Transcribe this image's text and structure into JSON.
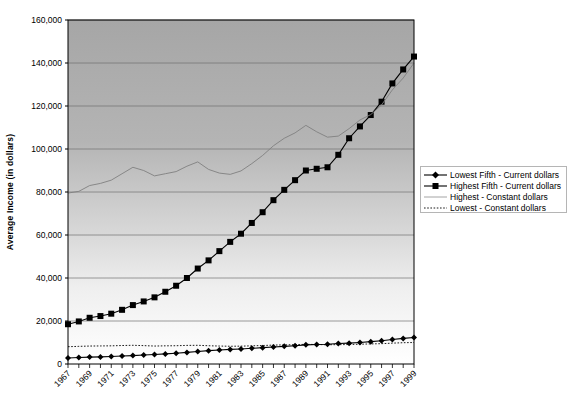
{
  "chart_data": {
    "type": "line",
    "title": "",
    "xlabel": "",
    "ylabel": "Average Income (in dollars)",
    "ylim": [
      0,
      160000
    ],
    "ytick_values": [
      0,
      20000,
      40000,
      60000,
      80000,
      100000,
      120000,
      140000,
      160000
    ],
    "ytick_labels": [
      "0",
      "20,000",
      "40,000",
      "60,000",
      "80,000",
      "100,000",
      "120,000",
      "140,000",
      "160,000"
    ],
    "grid": true,
    "grid_axis": "y",
    "legend_position": "right",
    "x": [
      1967,
      1968,
      1969,
      1970,
      1971,
      1972,
      1973,
      1974,
      1975,
      1976,
      1977,
      1978,
      1979,
      1980,
      1981,
      1982,
      1983,
      1984,
      1985,
      1986,
      1987,
      1988,
      1989,
      1990,
      1991,
      1992,
      1993,
      1994,
      1995,
      1996,
      1997,
      1998,
      1999
    ],
    "xtick_labels": [
      "1967",
      "1969",
      "1971",
      "1973",
      "1975",
      "1977",
      "1979",
      "1981",
      "1983",
      "1985",
      "1987",
      "1989",
      "1991",
      "1993",
      "1995",
      "1997",
      "1999"
    ],
    "xtick_values": [
      1967,
      1969,
      1971,
      1973,
      1975,
      1977,
      1979,
      1981,
      1983,
      1985,
      1987,
      1989,
      1991,
      1993,
      1995,
      1997,
      1999
    ],
    "series": [
      {
        "name": "Lowest Fifth - Current dollars",
        "marker": "diamond",
        "line_style": "solid",
        "color": "#000000",
        "values": [
          2800,
          3000,
          3200,
          3300,
          3500,
          3700,
          3900,
          4200,
          4400,
          4700,
          5000,
          5400,
          5800,
          6200,
          6500,
          6800,
          7000,
          7300,
          7600,
          7900,
          8200,
          8500,
          8900,
          9100,
          9200,
          9500,
          9700,
          10000,
          10400,
          10800,
          11400,
          11900,
          12300
        ]
      },
      {
        "name": "Highest Fifth - Current dollars",
        "marker": "square",
        "line_style": "solid",
        "color": "#000000",
        "values": [
          18500,
          19800,
          21500,
          22300,
          23400,
          25200,
          27400,
          29100,
          31000,
          33600,
          36400,
          40000,
          44400,
          48200,
          52500,
          56800,
          60600,
          65600,
          70600,
          76200,
          81000,
          85500,
          90000,
          90800,
          91500,
          97300,
          105000,
          110500,
          115800,
          122000,
          130500,
          137000,
          143000
        ]
      },
      {
        "name": "Highest - Constant dollars",
        "marker": "none",
        "line_style": "solid",
        "color": "#808080",
        "values": [
          79500,
          80300,
          83000,
          84000,
          85500,
          88500,
          91500,
          90000,
          87500,
          88500,
          89500,
          92000,
          94000,
          90500,
          88800,
          88200,
          89800,
          93200,
          97000,
          101500,
          105000,
          107500,
          111000,
          108000,
          105500,
          106000,
          109500,
          113500,
          116000,
          120500,
          127500,
          133000,
          140000
        ]
      },
      {
        "name": "Lowest - Constant dollars",
        "marker": "none",
        "line_style": "dotted",
        "color": "#000000",
        "values": [
          8050,
          8200,
          8350,
          8400,
          8450,
          8600,
          8700,
          8550,
          8350,
          8450,
          8500,
          8650,
          8700,
          8500,
          8350,
          8250,
          8300,
          8450,
          8600,
          8800,
          8900,
          9000,
          9150,
          9050,
          8950,
          9000,
          9050,
          9200,
          9350,
          9450,
          9700,
          9900,
          10000
        ]
      }
    ]
  },
  "legend": {
    "items": [
      {
        "label": "Lowest Fifth - Current dollars",
        "marker": "diamond",
        "style": "solid",
        "color": "#000000"
      },
      {
        "label": "Highest Fifth - Current dollars",
        "marker": "square",
        "style": "solid",
        "color": "#000000"
      },
      {
        "label": "Highest - Constant dollars",
        "marker": "none",
        "style": "solid",
        "color": "#9a9a9a"
      },
      {
        "label": "Lowest - Constant dollars",
        "marker": "none",
        "style": "dotted",
        "color": "#000000"
      }
    ]
  },
  "colors": {
    "plot_bg_top": "#a8a8a8",
    "plot_bg_bottom": "#ffffff",
    "gridline": "#6f6f6f",
    "axis": "#000000",
    "constant_line": "#8c8c8c"
  }
}
